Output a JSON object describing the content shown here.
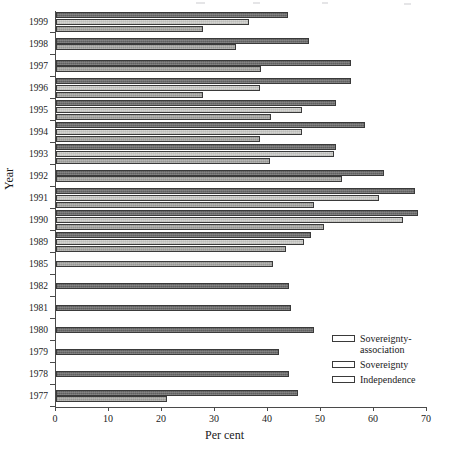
{
  "chart_data": {
    "type": "bar",
    "orientation": "horizontal",
    "title": "",
    "xlabel": "Per cent",
    "ylabel": "Year",
    "xlim": [
      0,
      70
    ],
    "xticks": [
      0,
      10,
      20,
      30,
      40,
      50,
      60,
      70
    ],
    "xtick_labels": [
      "0",
      "10",
      "20",
      "30",
      "40",
      "50",
      "60",
      "70"
    ],
    "grid": false,
    "legend_position": "lower-right",
    "categories": [
      "1999",
      "1998",
      "1997",
      "1996",
      "1995",
      "1994",
      "1993",
      "1992",
      "1991",
      "1990",
      "1989",
      "1985",
      "1982",
      "1981",
      "1980",
      "1979",
      "1978",
      "1977"
    ],
    "series": [
      {
        "name": "Sovereignty-association",
        "color": "#6e6e6e",
        "values": [
          43.8,
          47.8,
          55.7,
          55.7,
          52.8,
          58.3,
          52.8,
          61.8,
          67.8,
          68.3,
          48.1,
          null,
          43.9,
          44.3,
          48.6,
          42.1,
          43.9,
          45.6
        ]
      },
      {
        "name": "Sovereignty",
        "color": "#d5d5d2",
        "values": [
          36.4,
          null,
          null,
          38.5,
          46.5,
          46.5,
          52.4,
          null,
          61.0,
          65.4,
          46.8,
          null,
          null,
          null,
          null,
          null,
          null,
          null
        ]
      },
      {
        "name": "Independence",
        "color": "#a6a6a3",
        "values": [
          27.7,
          33.9,
          38.6,
          27.7,
          40.5,
          38.4,
          40.4,
          54.0,
          48.6,
          50.5,
          43.4,
          40.9,
          null,
          null,
          null,
          null,
          null,
          20.9
        ]
      }
    ]
  },
  "axes": {
    "x_title": "Per cent",
    "y_title": "Year"
  },
  "legend": {
    "items": [
      {
        "label": "Sovereignty-\nassociation",
        "key": "sovereignty-association"
      },
      {
        "label": "Sovereignty",
        "key": "sovereignty"
      },
      {
        "label": "Independence",
        "key": "independence"
      }
    ]
  }
}
